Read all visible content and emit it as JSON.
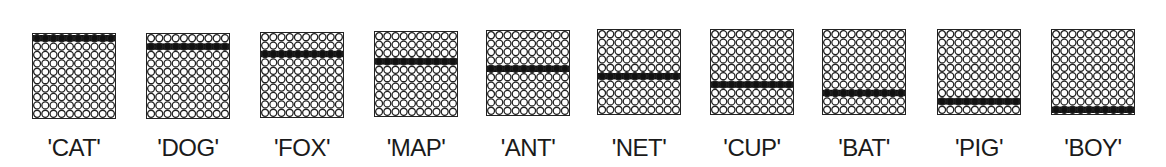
{
  "diagram": {
    "grid_rows": 10,
    "grid_cols": 10,
    "colors": {
      "empty_fill": "#ffffff",
      "stroke": "#222222",
      "filled": "#111111"
    },
    "panels": [
      {
        "label": "'CAT'",
        "filled_row": 0,
        "left": 18,
        "top": 33
      },
      {
        "label": "'DOG'",
        "filled_row": 1,
        "left": 132,
        "top": 33
      },
      {
        "label": "'FOX'",
        "filled_row": 2,
        "left": 246,
        "top": 32
      },
      {
        "label": "'MAP'",
        "filled_row": 3,
        "left": 360,
        "top": 31
      },
      {
        "label": "'ANT'",
        "filled_row": 4,
        "left": 472,
        "top": 30
      },
      {
        "label": "'NET'",
        "filled_row": 5,
        "left": 583,
        "top": 29
      },
      {
        "label": "'CUP'",
        "filled_row": 6,
        "left": 696,
        "top": 29
      },
      {
        "label": "'BAT'",
        "filled_row": 7,
        "left": 808,
        "top": 29
      },
      {
        "label": "'PIG'",
        "filled_row": 8,
        "left": 923,
        "top": 29
      },
      {
        "label": "'BOY'",
        "filled_row": 9,
        "left": 1037,
        "top": 29
      }
    ]
  }
}
